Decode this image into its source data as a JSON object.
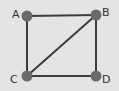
{
  "graph": {
    "nodes": [
      {
        "id": "A",
        "label": "A",
        "x": 27,
        "y": 16,
        "lx": 12,
        "ly": 9
      },
      {
        "id": "B",
        "label": "B",
        "x": 96,
        "y": 15,
        "lx": 102,
        "ly": 7
      },
      {
        "id": "C",
        "label": "C",
        "x": 27,
        "y": 76,
        "lx": 10,
        "ly": 74
      },
      {
        "id": "D",
        "label": "D",
        "x": 96,
        "y": 76,
        "lx": 102,
        "ly": 74
      }
    ],
    "edges": [
      [
        "A",
        "B"
      ],
      [
        "A",
        "C"
      ],
      [
        "B",
        "D"
      ],
      [
        "C",
        "D"
      ],
      [
        "B",
        "C"
      ]
    ],
    "colors": {
      "background": "#e4e4e4",
      "edge": "#3c3c3c",
      "node": "#6a6a6a",
      "label": "#333333"
    }
  }
}
